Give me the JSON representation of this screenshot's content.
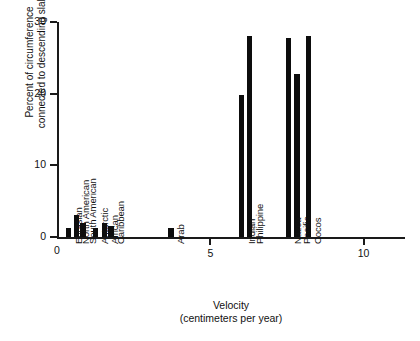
{
  "chart_data": {
    "type": "bar",
    "title": "",
    "xlabel": "Velocity (centimeters per year)",
    "ylabel": "Percent of circumference connected to descending slab",
    "ylabel_line1": "Percent of circumference",
    "ylabel_line2": "connected to descending slab",
    "xlabel_line1": "Velocity",
    "xlabel_line2": "(centimeters per year)",
    "ylim": [
      0,
      30
    ],
    "xlim": [
      0,
      11.35
    ],
    "y_ticks": [
      0,
      10,
      20,
      30
    ],
    "x_ticks": [
      0,
      5,
      10
    ],
    "grid": false,
    "legend": null,
    "bar_color": "#0d0d0d",
    "axis_color": "#1a1a1a",
    "categories": [
      "Eurasian",
      "North American",
      "South American",
      "Antarctic",
      "African",
      "Caribbean",
      "Arab",
      "Indian",
      "Philippine",
      "Nazca",
      "Pacific",
      "Cocos"
    ],
    "values": [
      1.3,
      3.1,
      2.0,
      1.3,
      2.0,
      1.5,
      1.3,
      19.8,
      28.0,
      27.8,
      22.8,
      28.0
    ],
    "x_positions": [
      0.38,
      0.63,
      0.85,
      1.25,
      1.55,
      1.76,
      3.72,
      6.02,
      6.28,
      7.55,
      7.83,
      8.2
    ],
    "bar_width_units": 0.17,
    "points": [
      {
        "plate": "Eurasian",
        "velocity": 0.38,
        "percent": 1.3
      },
      {
        "plate": "North American",
        "velocity": 0.63,
        "percent": 3.1
      },
      {
        "plate": "South American",
        "velocity": 0.85,
        "percent": 2.0
      },
      {
        "plate": "Antarctic",
        "velocity": 1.25,
        "percent": 1.3
      },
      {
        "plate": "African",
        "velocity": 1.55,
        "percent": 2.0
      },
      {
        "plate": "Caribbean",
        "velocity": 1.76,
        "percent": 1.5
      },
      {
        "plate": "Arab",
        "velocity": 3.72,
        "percent": 1.3
      },
      {
        "plate": "Indian",
        "velocity": 6.02,
        "percent": 19.8
      },
      {
        "plate": "Philippine",
        "velocity": 6.28,
        "percent": 28.0
      },
      {
        "plate": "Nazca",
        "velocity": 7.55,
        "percent": 27.8
      },
      {
        "plate": "Pacific",
        "velocity": 7.83,
        "percent": 22.8
      },
      {
        "plate": "Cocos",
        "velocity": 8.2,
        "percent": 28.0
      }
    ]
  }
}
